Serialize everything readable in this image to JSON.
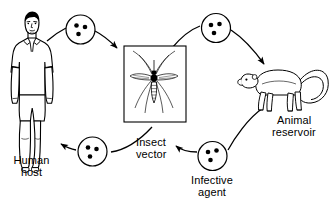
{
  "diagram": {
    "type": "cycle-diagram",
    "background_color": "#ffffff",
    "line_color": "#000000",
    "nodes": [
      {
        "id": "human-host",
        "label_line1": "Human",
        "label_line2": "host",
        "icon": "human-figure-icon",
        "position": "left"
      },
      {
        "id": "insect-vector",
        "label_line1": "Insect",
        "label_line2": "vector",
        "icon": "mosquito-icon",
        "position": "center",
        "framed": true
      },
      {
        "id": "animal-reservoir",
        "label_line1": "Animal",
        "label_line2": "reservoir",
        "icon": "monkey-icon",
        "position": "right"
      },
      {
        "id": "infective-agent",
        "label_line1": "Infective",
        "label_line2": "agent",
        "icon": "pathogen-circle-icon",
        "position": "bottom-center"
      }
    ],
    "agent_markers": [
      {
        "id": "agent-marker-top-left",
        "dots": 3,
        "on_arrow": "human-to-vector"
      },
      {
        "id": "agent-marker-top-right",
        "dots": 3,
        "on_arrow": "vector-to-reservoir"
      },
      {
        "id": "agent-marker-bottom-left",
        "dots": 3,
        "on_arrow": "vector-to-human"
      },
      {
        "id": "agent-marker-bottom-right",
        "dots": 3,
        "on_arrow": "reservoir-to-vector"
      }
    ],
    "arrows": [
      {
        "id": "human-to-vector",
        "from": "human-host",
        "to": "insect-vector",
        "direction": "right"
      },
      {
        "id": "vector-to-reservoir",
        "from": "insect-vector",
        "to": "animal-reservoir",
        "direction": "right-down"
      },
      {
        "id": "reservoir-to-vector",
        "from": "animal-reservoir",
        "to": "insect-vector",
        "direction": "left"
      },
      {
        "id": "vector-to-human",
        "from": "insect-vector",
        "to": "human-host",
        "direction": "left"
      }
    ]
  }
}
